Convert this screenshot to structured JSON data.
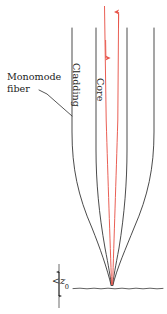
{
  "figure": {
    "type": "technical-diagram",
    "width": 167,
    "height": 314,
    "background_color": "#ffffff"
  },
  "labels": {
    "monomode_fiber": "Monomode fiber",
    "cladding": "Cladding",
    "core": "Core",
    "z0_less_than": "<",
    "z0_symbol": "z",
    "z0_subscript": "0"
  },
  "colors": {
    "outline": "#2b2b2b",
    "light_ray": "#e8564c",
    "text": "#1a1a1a",
    "surface_line": "#3a3a3a",
    "background": "#ffffff"
  },
  "geometry": {
    "cladding_left_x": 72,
    "cladding_right_x": 154,
    "core_left_x": 96,
    "core_right_x": 127,
    "taper_start_y": 134,
    "tip_x": 112,
    "tip_y": 286,
    "surface_y": 288,
    "top_y": 28
  },
  "rays": [
    {
      "name": "incoming-ray",
      "direction": "down",
      "x": 105,
      "color": "#e8564c"
    },
    {
      "name": "outgoing-ray",
      "direction": "up",
      "x": 118,
      "color": "#e8564c"
    }
  ]
}
